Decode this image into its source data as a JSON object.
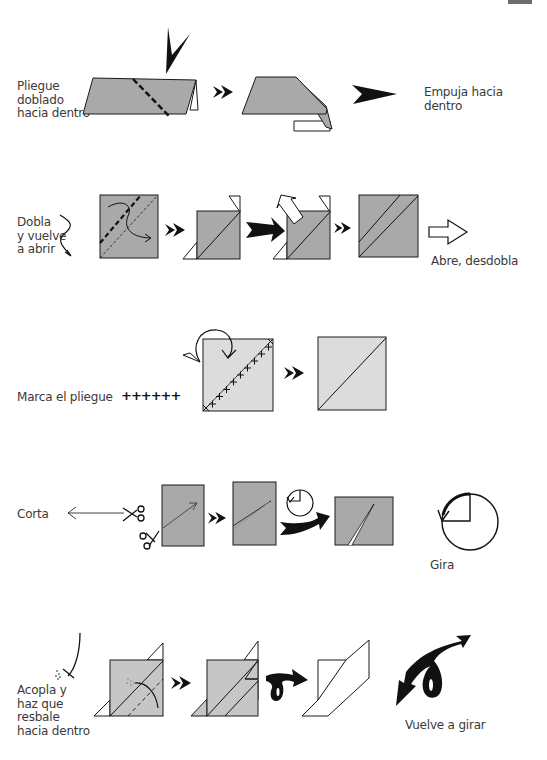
{
  "page": {
    "corner_tab_color": "#6d6d6d",
    "paper_dark": "#a9a9a9",
    "paper_light": "#dcdcdc",
    "line_color": "#1a1a1a"
  },
  "sections": [
    {
      "id": "inside-reverse-fold",
      "label": "Pliegue\ndoblado\nhacia dentro",
      "symbol_label": "Empuja hacia\ndentro",
      "symbol_icon": "push-arrowhead-icon"
    },
    {
      "id": "fold-and-unfold",
      "label": "Dobla\ny vuelve\na abrir",
      "symbol_label": "Abre, desdobla",
      "symbol_icon": "hollow-arrow-icon"
    },
    {
      "id": "crease",
      "label": "Marca el pliegue",
      "symbol_label": "++++++",
      "symbol_icon": "crease-marks-icon"
    },
    {
      "id": "cut",
      "label": "Corta",
      "symbol_label": "Gira",
      "symbol_icon": "rotate-icon"
    },
    {
      "id": "sink",
      "label": "Acopla y\nhaz que\nresbale\nhacia dentro",
      "symbol_label": "Vuelve a girar",
      "symbol_icon": "turn-over-icon"
    }
  ]
}
